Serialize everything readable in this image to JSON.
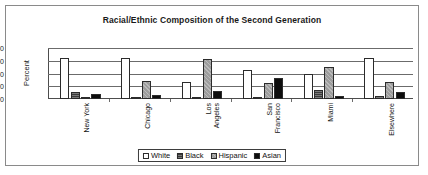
{
  "chart_data": {
    "type": "bar",
    "title": "Racial/Ethnic Composition of the Second Generation",
    "xlabel": "",
    "ylabel": "Percent",
    "ylim": [
      0,
      80
    ],
    "yticks": [
      0,
      20,
      40,
      60,
      80
    ],
    "grid": true,
    "legend_position": "bottom",
    "categories": [
      "New York",
      "Chicago",
      "Los Angeles",
      "San Francisco",
      "Miami",
      "Elsewhere"
    ],
    "category_lines": [
      [
        "New York"
      ],
      [
        "Chicago"
      ],
      [
        "Los",
        "Angeles"
      ],
      [
        "San",
        "Francisco"
      ],
      [
        "Miami"
      ],
      [
        "Elsewhere"
      ]
    ],
    "series": [
      {
        "name": "White",
        "fill": "#ffffff",
        "values": [
          64,
          64,
          26,
          45,
          40,
          65
        ]
      },
      {
        "name": "Black",
        "fill": "#3a3a3a",
        "values": [
          11,
          3,
          3,
          3,
          14,
          5
        ]
      },
      {
        "name": "Hispanic",
        "fill": "#9d9d9d",
        "values": [
          3,
          29,
          62,
          25,
          51,
          27
        ]
      },
      {
        "name": "Asian",
        "fill": "#0d0d0d",
        "values": [
          8,
          7,
          13,
          33,
          4,
          11
        ]
      }
    ]
  },
  "frame": {
    "border_color": "#8a8a8a",
    "background": "#ffffff"
  }
}
